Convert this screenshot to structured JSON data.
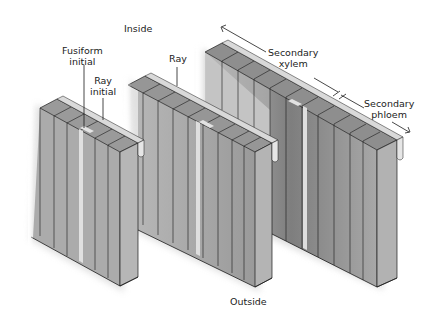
{
  "diagram": {
    "orientation_labels": {
      "inside": "Inside",
      "outside": "Outside"
    },
    "labels": {
      "fusiform_initial": [
        "Fusiform",
        "initial"
      ],
      "ray_initial": [
        "Ray",
        "initial"
      ],
      "ray": "Ray",
      "secondary_xylem": [
        "Secondary",
        "xylem"
      ],
      "secondary_phloem": [
        "Secondary",
        "phloem"
      ]
    },
    "blocks": [
      {
        "name": "cambium-block",
        "description": "Cambial layer with fusiform and ray initials"
      },
      {
        "name": "early-division-block",
        "description": "Cambium after initial divisions forming ray"
      },
      {
        "name": "mature-block",
        "description": "Secondary xylem (inside) and secondary phloem (outside)"
      }
    ],
    "colors": {
      "cell_fill": "#a9a9a9",
      "cell_dark": "#8c8c8c",
      "cell_light": "#c4c4c4",
      "ray_fill": "#d8d8d8",
      "outline": "#1a1a1a",
      "text": "#222222"
    }
  }
}
